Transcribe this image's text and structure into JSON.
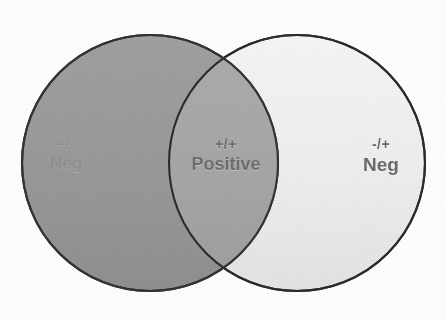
{
  "figure": {
    "type": "venn-diagram",
    "title": "",
    "background_color": "#ffffff",
    "width": 446,
    "height": 320
  },
  "chart_data": {
    "type": "venn",
    "title": "",
    "sets": [
      {
        "id": "left",
        "sign": "+/-",
        "label": "Neg",
        "region": "left-only",
        "fill": "#9a9a9a",
        "stroke": "#2b2b2b",
        "cx": 150,
        "cy": 163,
        "r": 128
      },
      {
        "id": "right",
        "sign": "-/+",
        "label": "Neg",
        "region": "right-only",
        "fill": "#f0f0f0",
        "stroke": "#2b2b2b",
        "cx": 297,
        "cy": 163,
        "r": 128
      }
    ],
    "intersection": {
      "id": "center",
      "sign": "+/+",
      "label": "Positive",
      "region": "overlap",
      "fill": "#a8a8a8"
    },
    "legend": null,
    "grid": false
  },
  "labels": {
    "left": {
      "sign": "+/-",
      "word": "Neg"
    },
    "center": {
      "sign": "+/+",
      "word": "Positive"
    },
    "right": {
      "sign": "-/+",
      "word": "Neg"
    }
  },
  "colors": {
    "left_fill": "#9a9a9a",
    "right_fill": "#f0f0f0",
    "overlap_fill": "#a8a8a8",
    "outline": "#2b2b2b",
    "background": "#ffffff",
    "label_left_text": "#8d8d8d",
    "label_center_text": "#6e6e6e",
    "label_right_text": "#6b6b6b"
  }
}
